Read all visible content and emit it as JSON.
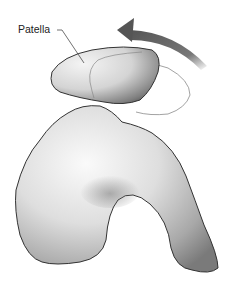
{
  "figure": {
    "labels": [
      {
        "id": "patella",
        "text": "Patella"
      }
    ],
    "elements": {
      "patella": "Patella (kneecap) bone",
      "femur": "Distal femur (trochlear groove)",
      "arrow": "Curved rotation arrow indicating lateral tilt of patella",
      "patella_outline": "Thin outline showing alternate patella position"
    },
    "colors": {
      "bone_light": "#f2f2f2",
      "bone_shadow": "#6a6a6a",
      "outline": "#3a3a3a",
      "arrow": "#5f5f5f"
    }
  }
}
